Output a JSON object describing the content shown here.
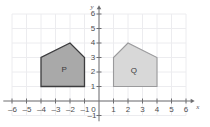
{
  "canvas": {
    "width": 210,
    "height": 127,
    "background": "#ffffff"
  },
  "colors": {
    "grid": "#ececef",
    "axis": "#6e6e71",
    "tick_text": "#4d4d4f",
    "shape_p_fill": "#a9a9a9",
    "shape_p_stroke": "#3c3c3e",
    "shape_q_fill": "#d8d8d8",
    "shape_q_stroke": "#9a9a9c",
    "label_text": "#3a3a3c"
  },
  "axes": {
    "x_label": "x",
    "y_label": "y",
    "origin_label": "0",
    "x_ticks": [
      -6,
      -5,
      -4,
      -3,
      -2,
      -1,
      1,
      2,
      3,
      4,
      5,
      6
    ],
    "y_ticks": [
      6,
      5,
      4,
      3,
      2,
      1,
      -1
    ],
    "x_tick_labels": [
      "–6",
      "–5",
      "–4",
      "–3",
      "–2",
      "–1",
      "1",
      "2",
      "3",
      "4",
      "5",
      "6"
    ],
    "y_tick_labels": [
      "6",
      "5",
      "4",
      "3",
      "2",
      "1",
      "–1"
    ],
    "x_range": [
      -6.6,
      6.6
    ],
    "y_range": [
      -1.4,
      6.6
    ],
    "grid": true,
    "grid_x_range": [
      -6,
      6
    ],
    "grid_y_range": [
      -1,
      6
    ],
    "unit_px": 14.5,
    "origin_px": [
      99,
      101
    ]
  },
  "chart_data": {
    "type": "scatter",
    "title": "",
    "xlabel": "x",
    "ylabel": "y",
    "xlim": [
      -6.6,
      6.6
    ],
    "ylim": [
      -1.4,
      6.6
    ],
    "grid": true,
    "legend": "none",
    "shapes": [
      {
        "name": "P",
        "label": "P",
        "label_at": [
          -2.4,
          2.15
        ],
        "fill": "#a9a9a9",
        "stroke": "#3c3c3e",
        "stroke_width": 1.3,
        "vertices": [
          [
            -4,
            1
          ],
          [
            -4,
            3
          ],
          [
            -2,
            4
          ],
          [
            -1,
            3
          ],
          [
            -1,
            1
          ]
        ]
      },
      {
        "name": "Q",
        "label": "Q",
        "label_at": [
          2.4,
          2.05
        ],
        "fill": "#d8d8d8",
        "stroke": "#9a9a9c",
        "stroke_width": 1.1,
        "vertices": [
          [
            1,
            1
          ],
          [
            1,
            3
          ],
          [
            2,
            4
          ],
          [
            4,
            3
          ],
          [
            4,
            1
          ]
        ]
      }
    ]
  }
}
